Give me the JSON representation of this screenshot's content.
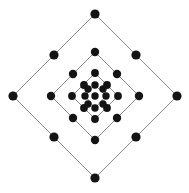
{
  "figure": {
    "background_color": "#ffffff",
    "line_color": "#8a8a8a",
    "dot_color": "#141414",
    "line_width": 1,
    "canvas": {
      "width": 189,
      "height": 193
    },
    "center": {
      "x": 95,
      "y": 96
    },
    "total_dots": 33,
    "ring_count": 4
  },
  "chart_data": {
    "type": "scatter",
    "subtitle": "",
    "xlabel": "",
    "ylabel": "",
    "xlim": [
      0,
      189
    ],
    "ylim": [
      0,
      193
    ],
    "grid": false,
    "legend": "none",
    "center": {
      "x": 95,
      "y": 96
    },
    "rings": [
      {
        "name": "ring-1-outer",
        "radius": 82,
        "dot_radius": 4.6,
        "dots": 8,
        "points": [
          {
            "label": "top",
            "x": 95,
            "y": 14
          },
          {
            "label": "top-right",
            "x": 136,
            "y": 55
          },
          {
            "label": "right",
            "x": 177,
            "y": 96
          },
          {
            "label": "bottom-right",
            "x": 136,
            "y": 137
          },
          {
            "label": "bottom",
            "x": 95,
            "y": 178
          },
          {
            "label": "bottom-left",
            "x": 54,
            "y": 137
          },
          {
            "label": "left",
            "x": 13,
            "y": 96
          },
          {
            "label": "top-left",
            "x": 54,
            "y": 55
          }
        ]
      },
      {
        "name": "ring-2",
        "radius": 44,
        "dot_radius": 4.2,
        "dots": 8,
        "points": [
          {
            "label": "top",
            "x": 95,
            "y": 52
          },
          {
            "label": "top-right",
            "x": 117,
            "y": 74
          },
          {
            "label": "right",
            "x": 139,
            "y": 96
          },
          {
            "label": "bottom-right",
            "x": 117,
            "y": 118
          },
          {
            "label": "bottom",
            "x": 95,
            "y": 140
          },
          {
            "label": "bottom-left",
            "x": 73,
            "y": 118
          },
          {
            "label": "left",
            "x": 51,
            "y": 96
          },
          {
            "label": "top-left",
            "x": 73,
            "y": 74
          }
        ]
      },
      {
        "name": "ring-3",
        "radius": 23,
        "dot_radius": 3.9,
        "dots": 8,
        "points": [
          {
            "label": "top",
            "x": 95,
            "y": 73
          },
          {
            "label": "top-right",
            "x": 107,
            "y": 85
          },
          {
            "label": "right",
            "x": 118,
            "y": 96
          },
          {
            "label": "bottom-right",
            "x": 107,
            "y": 108
          },
          {
            "label": "bottom",
            "x": 95,
            "y": 119
          },
          {
            "label": "bottom-left",
            "x": 84,
            "y": 108
          },
          {
            "label": "left",
            "x": 72,
            "y": 96
          },
          {
            "label": "top-left",
            "x": 84,
            "y": 85
          }
        ]
      },
      {
        "name": "ring-4-inner",
        "radius": 11,
        "dot_radius": 3.7,
        "dots": 8,
        "points": [
          {
            "label": "top",
            "x": 95,
            "y": 85
          },
          {
            "label": "top-right",
            "x": 103,
            "y": 89
          },
          {
            "label": "right",
            "x": 106,
            "y": 96
          },
          {
            "label": "bottom-right",
            "x": 103,
            "y": 104
          },
          {
            "label": "bottom",
            "x": 95,
            "y": 108
          },
          {
            "label": "bottom-left",
            "x": 88,
            "y": 104
          },
          {
            "label": "left",
            "x": 85,
            "y": 96
          },
          {
            "label": "top-left",
            "x": 88,
            "y": 89
          }
        ]
      }
    ],
    "center_point": {
      "label": "center",
      "x": 95,
      "y": 96,
      "dot_radius": 3.7
    }
  }
}
